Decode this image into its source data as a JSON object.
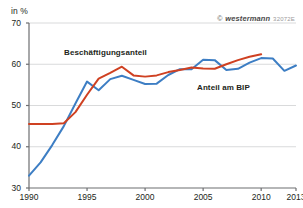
{
  "axis_unit": "in %",
  "copyright": {
    "mark": "©",
    "brand": "westermann",
    "code": "32072E"
  },
  "labels": {
    "employment_share": "Beschäftigungsanteil",
    "gdp_share": "Anteil am BIP"
  },
  "colors": {
    "employment_line": "#3d7ec4",
    "gdp_line": "#cf4122",
    "axis": "#6d6e71",
    "grid": "#d9dadb",
    "text": "#231f20",
    "background": "#ffffff"
  },
  "chart_data": {
    "type": "line",
    "title": "",
    "subtitle": "",
    "xlabel": "",
    "ylabel": "in %",
    "xlim": [
      1990,
      2013
    ],
    "ylim": [
      30,
      70
    ],
    "yticks": [
      30,
      40,
      50,
      60,
      70
    ],
    "ytick_labels": [
      "30",
      "40",
      "50",
      "60",
      "70"
    ],
    "xticks": [
      1990,
      1995,
      2000,
      2005,
      2010,
      2013
    ],
    "xtick_labels": [
      "1990",
      "1995",
      "2000",
      "2005",
      "2010",
      "2013"
    ],
    "grid": true,
    "grid_axis": "y",
    "legend": "inline-annotations",
    "x": [
      1990,
      1991,
      1992,
      1993,
      1994,
      1995,
      1996,
      1997,
      1998,
      1999,
      2000,
      2001,
      2002,
      2003,
      2004,
      2005,
      2006,
      2007,
      2008,
      2009,
      2010,
      2011,
      2012,
      2013
    ],
    "series": [
      {
        "name": "Beschäftigungsanteil",
        "color": "#3d7ec4",
        "values": [
          33.0,
          36.2,
          40.4,
          45.0,
          50.5,
          55.8,
          53.7,
          56.4,
          57.2,
          56.2,
          55.2,
          55.3,
          57.4,
          58.8,
          58.8,
          61.1,
          61.0,
          58.6,
          58.9,
          60.4,
          61.5,
          61.4,
          58.4,
          59.7
        ]
      },
      {
        "name": "Anteil am BIP",
        "color": "#cf4122",
        "values": [
          45.5,
          45.5,
          45.5,
          45.7,
          48.4,
          52.6,
          56.5,
          57.9,
          59.4,
          57.3,
          57.0,
          57.3,
          58.1,
          58.6,
          59.2,
          59.0,
          58.9,
          60.0,
          61.0,
          61.8,
          62.4,
          null,
          null,
          null
        ]
      }
    ],
    "annotations": [
      {
        "text": "Beschäftigungsanteil",
        "x": 1993.6,
        "y": 65.6
      },
      {
        "text": "Anteil am BIP",
        "x": 2004.4,
        "y": 56.8
      }
    ]
  }
}
